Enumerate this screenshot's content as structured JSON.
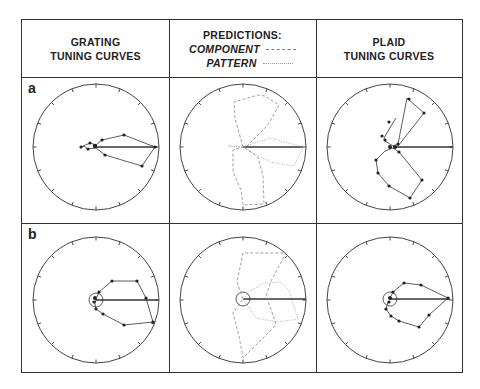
{
  "headers": {
    "col1": [
      "GRATING",
      "TUNING CURVES"
    ],
    "col2": {
      "title": "PREDICTIONS:",
      "legend": [
        {
          "label": "COMPONENT",
          "style": "dashed"
        },
        {
          "label": "PATTERN",
          "style": "dotted"
        }
      ]
    },
    "col3": [
      "PLAID",
      "TUNING CURVES"
    ]
  },
  "rows": [
    {
      "label": "a"
    },
    {
      "label": "b"
    }
  ],
  "chart_data": {
    "type": "polar",
    "layout": "2 rows (a, b) x 3 columns",
    "columns": [
      "Grating tuning curves",
      "Predictions: component (dashed), pattern (dotted)",
      "Plaid tuning curves"
    ],
    "angular_ticks": 16,
    "panels": [
      {
        "row": "a",
        "col": 1,
        "preferred_direction_deg": 0,
        "shape": "narrow unimodal lobe pointing right"
      },
      {
        "row": "a",
        "col": 2,
        "component": "bimodal lobes at ~+60 and ~-100 deg",
        "pattern": "unimodal lobe at 0 deg"
      },
      {
        "row": "a",
        "col": 3,
        "shape": "bimodal lobes at ~+55 and ~-55 deg (component-like)"
      },
      {
        "row": "b",
        "col": 1,
        "preferred_direction_deg": 0,
        "shape": "broad unimodal lobe pointing right",
        "baseline_circle": true
      },
      {
        "row": "b",
        "col": 2,
        "component": "bimodal broad lobes",
        "pattern": "unimodal broad lobe at 0 deg",
        "baseline_circle": true
      },
      {
        "row": "b",
        "col": 3,
        "shape": "unimodal lobe at 0 deg (pattern-like)",
        "baseline_circle": true
      }
    ]
  }
}
